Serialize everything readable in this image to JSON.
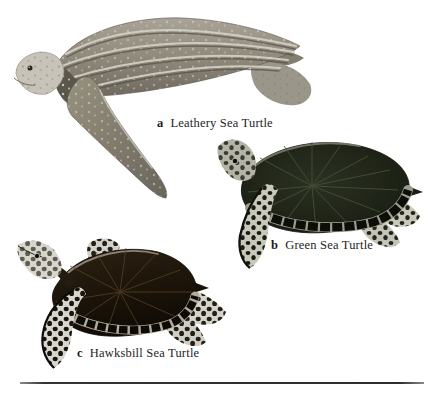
{
  "page": {
    "background": "#ffffff",
    "figure_type": "labeled species illustration plate",
    "captions": [
      {
        "marker": "a",
        "label": "Leathery Sea Turtle"
      },
      {
        "marker": "b",
        "label": "Green Sea Turtle"
      },
      {
        "marker": "c",
        "label": "Hawksbill Sea Turtle"
      }
    ],
    "palette": {
      "leatherback_body": "#8f8a7d",
      "leatherback_ridge_highlight": "#d9d5c9",
      "leatherback_head": "#c7c3b8",
      "green_turtle_carapace": "#1c2115",
      "green_turtle_streak": "#4a5236",
      "hawksbill_carapace": "#211709",
      "hawksbill_streak": "#5c4628",
      "flipper_mottle_dark": "#101208",
      "flipper_mottle_light": "#c9c9bb",
      "caption_text": "#1d1d1d",
      "divider": "#2d2d2d"
    }
  }
}
